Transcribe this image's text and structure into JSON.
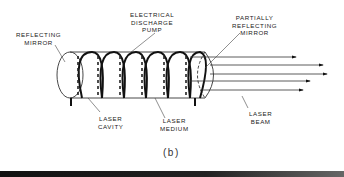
{
  "figure": {
    "caption": "(b)",
    "labels": {
      "reflecting_mirror": "REFLECTING\nMIRROR",
      "electrical_discharge_pump": "ELECTRICAL\nDISCHARGE\nPUMP",
      "partially_reflecting_mirror": "PARTIALLY\nREFLECTING\nMIRROR",
      "laser_cavity": "LASER\nCAVITY",
      "laser_medium": "LASER\nMEDIUM",
      "laser_beam": "LASER\nBEAM"
    },
    "coil_turns": 6,
    "beam_arrows": 5,
    "colors": {
      "ink": "#222222",
      "background": "#ffffff"
    }
  }
}
